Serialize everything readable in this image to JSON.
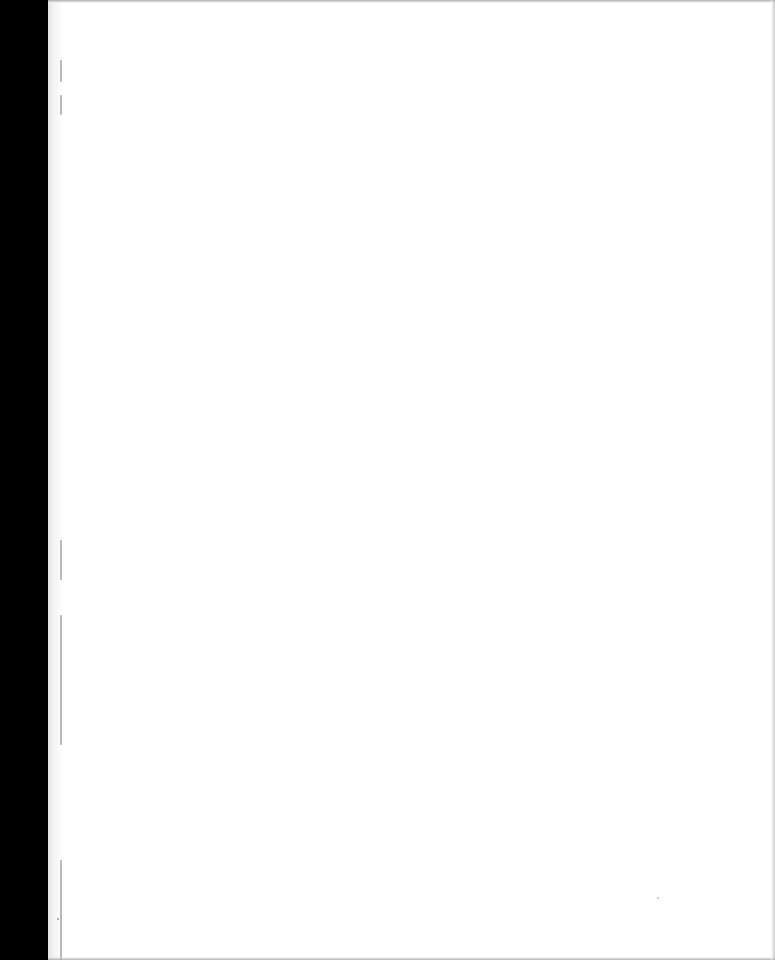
{
  "page": {
    "type": "scanned-blank-page",
    "content": "",
    "colors": {
      "paper": "#ffffff",
      "scan_margin": "#000000",
      "binding_edge": "#e4e4e4"
    }
  }
}
